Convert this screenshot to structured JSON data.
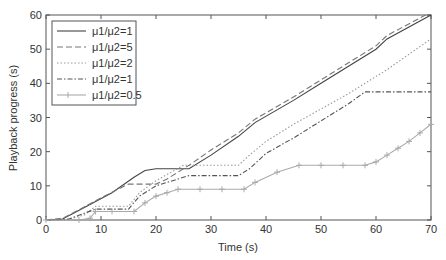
{
  "chart_data": {
    "type": "line",
    "title": "",
    "xlabel": "Time (s)",
    "ylabel": "Playback progress (s)",
    "xlim": [
      0,
      70
    ],
    "ylim": [
      0,
      60
    ],
    "xticks": [
      0,
      10,
      20,
      30,
      40,
      50,
      60,
      70
    ],
    "yticks": [
      0,
      10,
      20,
      30,
      40,
      50,
      60
    ],
    "grid": false,
    "legend_position": "top-left",
    "series": [
      {
        "name": "μ1/μ2=1",
        "style": "solid",
        "color": "#444444",
        "points": [
          [
            0,
            0
          ],
          [
            3,
            0.3
          ],
          [
            5,
            2
          ],
          [
            8,
            4.5
          ],
          [
            12,
            8
          ],
          [
            16,
            12.5
          ],
          [
            18,
            14.5
          ],
          [
            20,
            15
          ],
          [
            26,
            15
          ],
          [
            30,
            19
          ],
          [
            35,
            24.5
          ],
          [
            38,
            28.5
          ],
          [
            45,
            35
          ],
          [
            50,
            40
          ],
          [
            55,
            45
          ],
          [
            60,
            50
          ],
          [
            62,
            53
          ],
          [
            70,
            60
          ]
        ]
      },
      {
        "name": "μ1/μ2=5",
        "style": "dashed",
        "color": "#777777",
        "points": [
          [
            0,
            0
          ],
          [
            3,
            0.5
          ],
          [
            6,
            3
          ],
          [
            10,
            6.5
          ],
          [
            15,
            10.5
          ],
          [
            20,
            10.5
          ],
          [
            22,
            12
          ],
          [
            26,
            16
          ],
          [
            30,
            20.5
          ],
          [
            35,
            25.5
          ],
          [
            38,
            29.5
          ],
          [
            45,
            36
          ],
          [
            50,
            41
          ],
          [
            55,
            46
          ],
          [
            60,
            51
          ],
          [
            62,
            54
          ],
          [
            69,
            60
          ]
        ]
      },
      {
        "name": "μ1/μ2=2",
        "style": "dotted",
        "color": "#999999",
        "points": [
          [
            0,
            0
          ],
          [
            4,
            0.2
          ],
          [
            7,
            1.5
          ],
          [
            9,
            4
          ],
          [
            15,
            4
          ],
          [
            17,
            8
          ],
          [
            20,
            11.5
          ],
          [
            25,
            16
          ],
          [
            30,
            16
          ],
          [
            35,
            16
          ],
          [
            37,
            19
          ],
          [
            40,
            23
          ],
          [
            45,
            28
          ],
          [
            50,
            32.5
          ],
          [
            55,
            37
          ],
          [
            58,
            40
          ],
          [
            62,
            44
          ],
          [
            66,
            48.5
          ],
          [
            70,
            53
          ]
        ]
      },
      {
        "name": "μ1/μ2=1",
        "style": "dashdot",
        "color": "#555555",
        "points": [
          [
            0,
            0
          ],
          [
            4,
            0.2
          ],
          [
            7,
            2
          ],
          [
            9,
            3.2
          ],
          [
            15,
            3.2
          ],
          [
            17,
            7
          ],
          [
            20,
            10
          ],
          [
            24,
            12
          ],
          [
            26,
            13
          ],
          [
            35,
            13
          ],
          [
            37,
            15
          ],
          [
            40,
            19.5
          ],
          [
            45,
            24
          ],
          [
            50,
            29
          ],
          [
            55,
            34
          ],
          [
            58,
            37.5
          ],
          [
            70,
            37.5
          ]
        ]
      },
      {
        "name": "μ1/μ2=0.5",
        "style": "plus-markers",
        "color": "#aaaaaa",
        "points": [
          [
            0,
            0
          ],
          [
            6,
            0
          ],
          [
            8,
            0.5
          ],
          [
            9,
            2.5
          ],
          [
            12,
            2.5
          ],
          [
            16,
            2.5
          ],
          [
            18,
            5
          ],
          [
            20,
            7
          ],
          [
            22,
            8
          ],
          [
            24,
            9
          ],
          [
            28,
            9
          ],
          [
            32,
            9
          ],
          [
            36,
            9
          ],
          [
            38,
            11
          ],
          [
            42,
            14
          ],
          [
            46,
            16
          ],
          [
            50,
            16
          ],
          [
            54,
            16
          ],
          [
            58,
            16
          ],
          [
            60,
            17
          ],
          [
            62,
            19
          ],
          [
            64,
            21
          ],
          [
            66,
            23
          ],
          [
            68,
            25.5
          ],
          [
            70,
            28
          ]
        ]
      }
    ]
  }
}
